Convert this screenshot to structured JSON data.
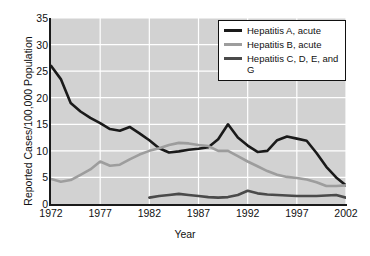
{
  "chart_data": {
    "type": "line",
    "title": "",
    "xlabel": "Year",
    "ylabel": "Reported Cases/100,000 Population",
    "xlim": [
      1972,
      2002
    ],
    "ylim": [
      0,
      35
    ],
    "xticks": [
      1972,
      1977,
      1982,
      1987,
      1992,
      1997,
      2002
    ],
    "yticks": [
      0,
      5,
      10,
      15,
      20,
      25,
      30,
      35
    ],
    "grid": true,
    "grid_color": "#ffffff",
    "plot_background": "#d2d2d2",
    "legend_position": "top-right",
    "series": [
      {
        "name": "Hepatitis A, acute",
        "color": "#1a1a1a",
        "x": [
          1972,
          1973,
          1974,
          1975,
          1976,
          1977,
          1978,
          1979,
          1980,
          1981,
          1982,
          1983,
          1984,
          1985,
          1986,
          1987,
          1988,
          1989,
          1990,
          1991,
          1992,
          1993,
          1994,
          1995,
          1996,
          1997,
          1998,
          1999,
          2000,
          2001,
          2002
        ],
        "values": [
          26.0,
          23.5,
          19.0,
          17.4,
          16.2,
          15.2,
          14.1,
          13.8,
          14.5,
          13.3,
          12.0,
          10.5,
          9.7,
          9.9,
          10.2,
          10.4,
          10.7,
          12.2,
          15.0,
          12.5,
          11.0,
          9.8,
          10.0,
          12.0,
          12.7,
          12.3,
          11.9,
          9.6,
          7.0,
          5.0,
          3.5
        ]
      },
      {
        "name": "Hepatitis B, acute",
        "color": "#9d9d9d",
        "x": [
          1972,
          1973,
          1974,
          1975,
          1976,
          1977,
          1978,
          1979,
          1980,
          1981,
          1982,
          1983,
          1984,
          1985,
          1986,
          1987,
          1988,
          1989,
          1990,
          1991,
          1992,
          1993,
          1994,
          1995,
          1996,
          1997,
          1998,
          1999,
          2000,
          2001,
          2002
        ],
        "values": [
          4.7,
          4.2,
          4.5,
          5.5,
          6.5,
          8.0,
          7.2,
          7.4,
          8.4,
          9.3,
          10.0,
          10.5,
          11.1,
          11.5,
          11.4,
          11.1,
          10.9,
          10.0,
          10.0,
          9.0,
          8.0,
          7.1,
          6.2,
          5.5,
          5.1,
          4.9,
          4.6,
          4.1,
          3.4,
          3.4,
          3.5
        ]
      },
      {
        "name": "Hepatitis C, D, E, and G",
        "color": "#4a4a4a",
        "x": [
          1982,
          1983,
          1984,
          1985,
          1986,
          1987,
          1988,
          1989,
          1990,
          1991,
          1992,
          1993,
          1994,
          1995,
          1996,
          1997,
          1998,
          1999,
          2000,
          2001,
          2002
        ],
        "values": [
          1.2,
          1.5,
          1.7,
          1.9,
          1.7,
          1.5,
          1.3,
          1.2,
          1.3,
          1.7,
          2.5,
          2.0,
          1.8,
          1.7,
          1.6,
          1.5,
          1.5,
          1.5,
          1.6,
          1.7,
          1.2
        ]
      }
    ],
    "legend_entries": [
      {
        "label": "Hepatitis A, acute",
        "color": "#1a1a1a"
      },
      {
        "label": "Hepatitis B, acute",
        "color": "#9d9d9d"
      },
      {
        "label": "Hepatitis C, D, E, and G",
        "color": "#4a4a4a"
      }
    ]
  }
}
